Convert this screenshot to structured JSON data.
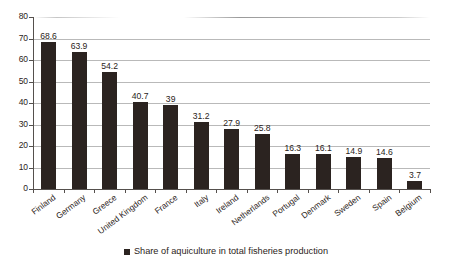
{
  "chart_data": {
    "type": "bar",
    "title": "",
    "subtitle": "",
    "xlabel": "",
    "ylabel": "",
    "ylim": [
      0,
      80
    ],
    "yticks": [
      "0",
      "10",
      "20",
      "30",
      "40",
      "50",
      "60",
      "70",
      "80"
    ],
    "grid": true,
    "legend_position": "bottom",
    "series": [
      {
        "name": "Share of aquiculture in total fisheries production",
        "color": "#2b2320",
        "values": [
          68.6,
          63.9,
          54.2,
          40.7,
          39,
          31.2,
          27.9,
          25.8,
          16.3,
          16.1,
          14.9,
          14.6,
          3.7
        ]
      }
    ],
    "categories": [
      "Finland",
      "Germany",
      "Greece",
      "United Kingdom",
      "France",
      "Italy",
      "Ireland",
      "Netherlands",
      "Portugal",
      "Denmark",
      "Sweden",
      "Spain",
      "Belgium"
    ],
    "data_labels": [
      "68.6",
      "63.9",
      "54.2",
      "40.7",
      "39",
      "31.2",
      "27.9",
      "25.8",
      "16.3",
      "16.1",
      "14.9",
      "14.6",
      "3.7"
    ]
  },
  "legend": {
    "items": [
      {
        "label": "Share of aquiculture in total fisheries production",
        "color": "#2b2320",
        "marker": "square-marker"
      }
    ]
  },
  "colors": {
    "bar": "#2b2320",
    "axis": "#55504d",
    "gridline": "#b9b9b9",
    "background": "#ffffff",
    "text": "#2b2320"
  }
}
